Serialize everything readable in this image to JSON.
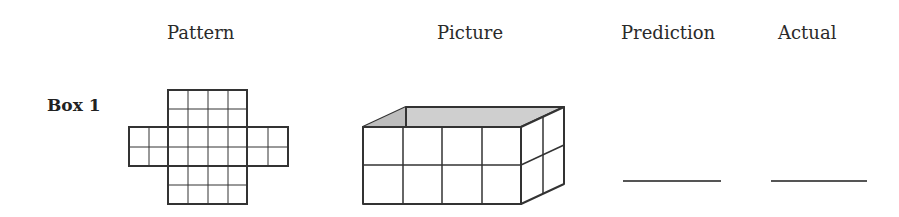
{
  "headers": {
    "pattern": "Pattern",
    "picture": "Picture",
    "prediction": "Prediction",
    "actual": "Actual"
  },
  "rows": [
    {
      "label": "Box 1",
      "pattern": {
        "type": "box-net",
        "center": {
          "cols": 4,
          "rows": 2
        },
        "top_flap": {
          "cols": 4,
          "rows": 2
        },
        "bottom_flap": {
          "cols": 4,
          "rows": 2
        },
        "left_flap": {
          "cols": 2,
          "rows": 2
        },
        "right_flap": {
          "cols": 2,
          "rows": 2
        }
      },
      "picture": {
        "type": "open-box-3d",
        "length_cubes": 4,
        "width_cubes": 2,
        "height_cubes": 2,
        "interior_color": "#c8c8c8"
      },
      "prediction": "",
      "actual": ""
    }
  ]
}
